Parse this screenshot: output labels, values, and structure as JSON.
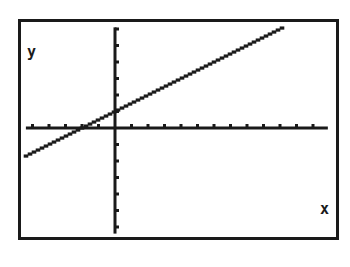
{
  "chart_data": {
    "type": "line",
    "title": "",
    "xlabel": "x",
    "ylabel": "y",
    "equation": "y = 0.5x + 1",
    "series": [
      {
        "name": "y = 0.5x + 1",
        "slope": 0.5,
        "intercept": 1,
        "x": [
          -5.4,
          -2,
          0,
          2,
          4,
          6,
          8,
          10.3
        ],
        "values": [
          -1.7,
          0,
          1,
          2,
          3,
          4,
          5,
          6.15
        ]
      }
    ],
    "xlim": [
      -5.4,
      12.9
    ],
    "ylim": [
      -6.4,
      6.1
    ],
    "xtick_step": 1,
    "ytick_step": 1,
    "xticks_negative": [
      -1,
      -2,
      -3,
      -4,
      -5
    ],
    "xticks_positive": [
      1,
      2,
      3,
      4,
      5,
      6,
      7,
      8,
      9,
      10,
      11,
      12
    ],
    "yticks_positive": [
      1,
      2,
      3,
      4,
      5,
      6
    ],
    "yticks_negative": [
      -1,
      -2,
      -3,
      -4,
      -5,
      -6
    ],
    "x_intercept": -2,
    "y_intercept": 1,
    "grid": false,
    "legend": "none"
  },
  "labels": {
    "x_axis": "x",
    "y_axis": "y"
  },
  "colors": {
    "ink": "#1a1a1a",
    "background": "#ffffff"
  }
}
